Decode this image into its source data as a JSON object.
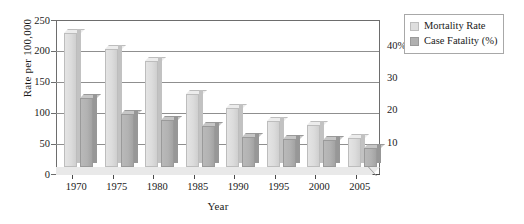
{
  "chart_data": {
    "type": "bar",
    "title": "",
    "subtitle": "",
    "xlabel": "Year",
    "ylabel": "Rate per 100,000",
    "y2label": "",
    "categories": [
      "1970",
      "1975",
      "1980",
      "1985",
      "1990",
      "1995",
      "2000",
      "2005"
    ],
    "series": [
      {
        "name": "Mortality Rate",
        "axis": "left",
        "color": "#dedede",
        "values": [
          228,
          200,
          180,
          125,
          100,
          78,
          72,
          50
        ]
      },
      {
        "name": "Case Fatality (%)",
        "axis": "right",
        "color": "#b0b0b0",
        "values": [
          22.0,
          17.0,
          15.0,
          13.0,
          9.5,
          9.0,
          8.5,
          6.0
        ]
      }
    ],
    "ylim": [
      0,
      250
    ],
    "yticks": [
      "0",
      "50",
      "100",
      "150",
      "200",
      "250"
    ],
    "y2lim": [
      0,
      47
    ],
    "y2ticks": [
      "10",
      "20",
      "30",
      "40%"
    ],
    "grid": true,
    "legend_position": "top-right",
    "legend": [
      "Mortality Rate",
      "Case Fatality (%)"
    ],
    "annotations": []
  },
  "axes": {
    "y_title": "Rate per 100,000",
    "x_title": "Year",
    "y_ticks": [
      {
        "label": "250",
        "value": 250
      },
      {
        "label": "200",
        "value": 200
      },
      {
        "label": "150",
        "value": 150
      },
      {
        "label": "100",
        "value": 100
      },
      {
        "label": "50",
        "value": 50
      },
      {
        "label": "0",
        "value": 0
      }
    ],
    "y2_ticks": [
      {
        "label": "40%",
        "value": 40
      },
      {
        "label": "30",
        "value": 30
      },
      {
        "label": "20",
        "value": 20
      },
      {
        "label": "10",
        "value": 10
      }
    ],
    "x_ticks": [
      "1970",
      "1975",
      "1980",
      "1985",
      "1990",
      "1995",
      "2000",
      "2005"
    ]
  },
  "legend": {
    "items": [
      {
        "label": "Mortality Rate",
        "swatch": "light"
      },
      {
        "label": "Case Fatality (%)",
        "swatch": "dark"
      }
    ]
  }
}
